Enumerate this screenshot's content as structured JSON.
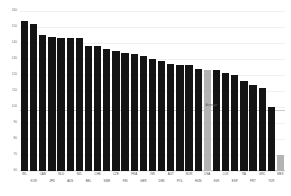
{
  "chart_data": {
    "type": "bar",
    "title": "",
    "subtitle": "",
    "xlabel": "",
    "ylabel": "",
    "ylim": [
      60,
      160
    ],
    "ytick_values": [
      160,
      150,
      140,
      130,
      120,
      110,
      100,
      90,
      80,
      70,
      60
    ],
    "ytick_labels": [
      "160",
      "150",
      "140",
      "130",
      "120",
      "110",
      "100",
      "90",
      "80",
      "70",
      "60"
    ],
    "grid": true,
    "legend": "none",
    "annotations": [
      {
        "name": "average-line",
        "label": "Average",
        "value": 98
      }
    ],
    "highlight_color": "#b3b3b3",
    "bar_color": "#141414",
    "categories": [
      "IRL",
      "KOR",
      "CAN",
      "JPN",
      "NLD",
      "AUS",
      "NZL",
      "BEL",
      "CHE",
      "SWE",
      "CZE",
      "FIN",
      "FRA",
      "GER",
      "ISR",
      "DNK",
      "AUT",
      "POL",
      "NOR",
      "HUN",
      "USA",
      "SVK",
      "LUX",
      "ESP",
      "ITA",
      "PRT",
      "GRC",
      "TUR",
      "MEX"
    ],
    "values": [
      154,
      152,
      145,
      144,
      143,
      143,
      143,
      138,
      138,
      136,
      135,
      134,
      133,
      132,
      130,
      129,
      127,
      126,
      126,
      124,
      123,
      123,
      121,
      120,
      116,
      114,
      112,
      100,
      70
    ],
    "highlighted": [
      "USA",
      "MEX"
    ]
  }
}
